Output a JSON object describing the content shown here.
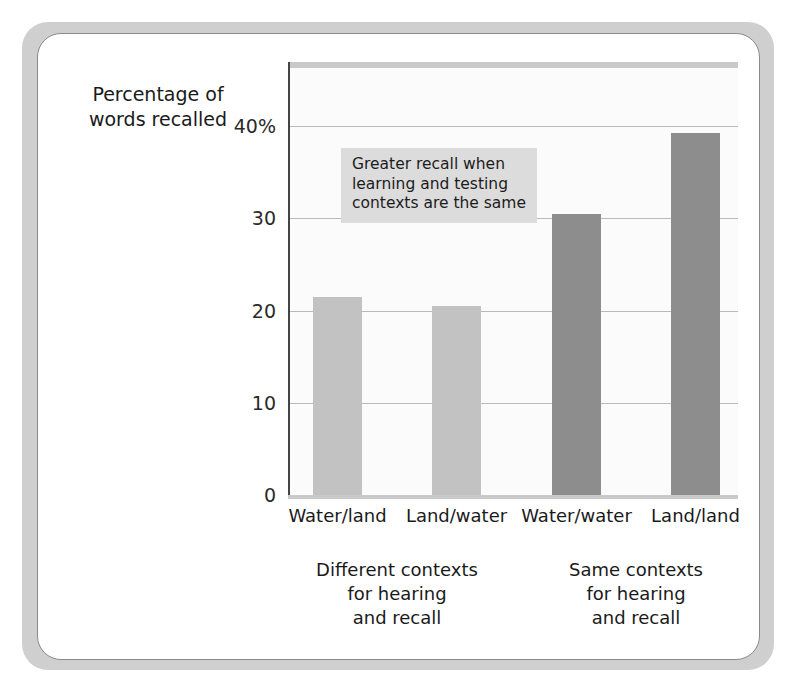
{
  "chart_data": {
    "type": "bar",
    "title": "",
    "xlabel": "",
    "ylabel": "Percentage of words recalled",
    "ylabel_lines": [
      "Percentage of",
      "words recalled"
    ],
    "categories": [
      "Water/land",
      "Land/water",
      "Water/water",
      "Land/land"
    ],
    "values": [
      21.5,
      20.5,
      30.5,
      39.3
    ],
    "ylim": [
      0,
      45
    ],
    "yticks": [
      0,
      10,
      20,
      30,
      40
    ],
    "ytick_labels": [
      "0",
      "10",
      "20",
      "30",
      "40%"
    ],
    "grid": true,
    "gridlines_at": [
      10,
      20,
      30,
      40
    ],
    "legend": "none",
    "series": [
      {
        "name": "Percentage of words recalled",
        "values": [
          21.5,
          20.5,
          30.5,
          39.3
        ],
        "bar_colors": [
          "#c2c2c2",
          "#c2c2c2",
          "#8d8d8d",
          "#8d8d8d"
        ]
      }
    ],
    "annotations": [
      {
        "name": "callout",
        "lines": [
          "Greater recall when",
          "learning and testing",
          "contexts are the same"
        ],
        "background": "#dcdcdc"
      }
    ],
    "group_captions": [
      {
        "lines": [
          "Different contexts",
          "for hearing",
          "and recall"
        ],
        "spans": [
          "Water/land",
          "Land/water"
        ]
      },
      {
        "lines": [
          "Same contexts",
          "for hearing",
          "and recall"
        ],
        "spans": [
          "Water/water",
          "Land/land"
        ]
      }
    ]
  },
  "colors": {
    "bar_light": "#c2c2c2",
    "bar_dark": "#8d8d8d",
    "gridline": "#b9b9b9",
    "axis": "#444444",
    "plot_background": "#fbfbfb",
    "annotation_background": "#dcdcdc",
    "frame": "#cfcfcf",
    "card_border": "#8a8a8a",
    "text": "#1a1a1a"
  }
}
